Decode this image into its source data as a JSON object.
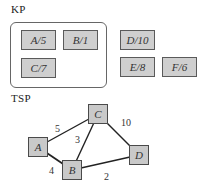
{
  "kp": {
    "title": "KP",
    "selected_items": [
      {
        "id": "A",
        "label": "A/5",
        "weight": 5
      },
      {
        "id": "B",
        "label": "B/1",
        "weight": 1
      },
      {
        "id": "C",
        "label": "C/7",
        "weight": 7
      }
    ],
    "other_items": [
      {
        "id": "D",
        "label": "D/10",
        "weight": 10
      },
      {
        "id": "E",
        "label": "E/8",
        "weight": 8
      },
      {
        "id": "F",
        "label": "F/6",
        "weight": 6
      }
    ]
  },
  "tsp": {
    "title": "TSP",
    "nodes": [
      {
        "id": "A",
        "label": "A"
      },
      {
        "id": "B",
        "label": "B"
      },
      {
        "id": "C",
        "label": "C"
      },
      {
        "id": "D",
        "label": "D"
      }
    ],
    "edges": [
      {
        "from": "A",
        "to": "C",
        "weight": "5"
      },
      {
        "from": "B",
        "to": "C",
        "weight": "3"
      },
      {
        "from": "C",
        "to": "D",
        "weight": "10"
      },
      {
        "from": "A",
        "to": "B",
        "weight": "4"
      },
      {
        "from": "B",
        "to": "D",
        "weight": "2"
      }
    ]
  },
  "colors": {
    "box_fill": "#cfcfcf",
    "box_border": "#5a5a5a",
    "edge": "#222222"
  }
}
